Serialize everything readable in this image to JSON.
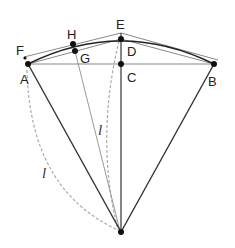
{
  "diagram": {
    "type": "geometry-construction",
    "points": {
      "A": {
        "label": "A",
        "x": 28,
        "y": 64
      },
      "B": {
        "label": "B",
        "x": 214,
        "y": 64
      },
      "C": {
        "label": "C",
        "x": 121,
        "y": 64
      },
      "D": {
        "label": "D",
        "x": 121,
        "y": 39
      },
      "E": {
        "label": "E",
        "x": 121,
        "y": 33
      },
      "F": {
        "label": "F",
        "x": 25,
        "y": 58
      },
      "G": {
        "label": "G",
        "x": 75,
        "y": 51
      },
      "H": {
        "label": "H",
        "x": 73,
        "y": 44
      },
      "O": {
        "label": "",
        "x": 121,
        "y": 232
      }
    },
    "length_labels": [
      {
        "text": "l",
        "x": 100,
        "y": 133
      },
      {
        "text": "l",
        "x": 43,
        "y": 176
      }
    ],
    "colors": {
      "primary_line": "#333333",
      "secondary_line": "#999999",
      "dashed_line": "#aaaaaa",
      "point": "#111111"
    }
  }
}
